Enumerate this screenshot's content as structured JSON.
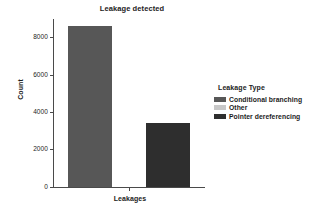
{
  "chart_data": {
    "type": "bar",
    "title": "Leakage detected",
    "xlabel": "Leakages",
    "ylabel": "Count",
    "categories": [
      "Conditional branching",
      "Pointer dereferencing"
    ],
    "values": [
      8650,
      3450
    ],
    "colors": [
      "#575757",
      "#2e2e2e"
    ],
    "ylim": [
      0,
      9000
    ],
    "yticks": [
      0,
      2000,
      4000,
      6000,
      8000
    ],
    "ytick_labels": [
      "0",
      "2000",
      "4000",
      "6000",
      "8000"
    ],
    "xtick_labels": [
      ""
    ],
    "grid": false,
    "legend": {
      "position": "right",
      "title": "Leakage Type",
      "entries": [
        {
          "label": "Conditional branching",
          "color": "#575757"
        },
        {
          "label": "Other",
          "color": "#c8c8c8"
        },
        {
          "label": "Pointer dereferencing",
          "color": "#2e2e2e"
        }
      ]
    }
  }
}
